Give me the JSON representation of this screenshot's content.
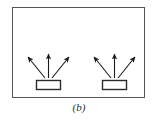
{
  "figure": {
    "label": "(b)",
    "type": "schematic-diagram",
    "colors": {
      "background": "#ffffff",
      "frame_stroke": "#555555",
      "arrow_stroke": "#1a1a1a",
      "box_stroke": "#2b2b2b",
      "box_fill": "#ffffff",
      "caption": "#2b2b2b"
    },
    "frame": {
      "x": 12,
      "y": 7,
      "width": 133,
      "height": 91,
      "stroke_width": 1
    },
    "emitters": [
      {
        "name": "left-emitter",
        "box": {
          "x": 36,
          "y": 80,
          "width": 25,
          "height": 10
        },
        "arrows": [
          {
            "name": "arrow-up-left",
            "x1": 45,
            "y1": 78,
            "x2": 27,
            "y2": 56
          },
          {
            "name": "arrow-up",
            "x1": 48,
            "y1": 78,
            "x2": 48,
            "y2": 52
          },
          {
            "name": "arrow-up-right",
            "x1": 52,
            "y1": 78,
            "x2": 70,
            "y2": 56
          }
        ]
      },
      {
        "name": "right-emitter",
        "box": {
          "x": 102,
          "y": 80,
          "width": 25,
          "height": 10
        },
        "arrows": [
          {
            "name": "arrow-up-left",
            "x1": 111,
            "y1": 78,
            "x2": 93,
            "y2": 56
          },
          {
            "name": "arrow-up",
            "x1": 114,
            "y1": 78,
            "x2": 114,
            "y2": 52
          },
          {
            "name": "arrow-up-right",
            "x1": 118,
            "y1": 78,
            "x2": 136,
            "y2": 56
          }
        ]
      }
    ],
    "caption": {
      "x": 79,
      "y": 110
    }
  }
}
